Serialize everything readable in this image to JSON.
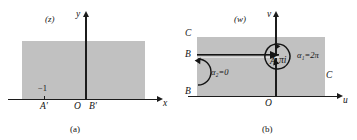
{
  "figure": {
    "panels": [
      {
        "id": "a",
        "caption": "(a)",
        "plane_tag": "(z)",
        "axes": {
          "x_label": "x",
          "y_label": "y"
        },
        "origin_label": "O",
        "point_labels": [
          {
            "name": "A-prime",
            "text": "A′"
          },
          {
            "name": "B-prime",
            "text": "B′"
          }
        ],
        "tick_label": "−1"
      },
      {
        "id": "b",
        "caption": "(b)",
        "plane_tag": "(w)",
        "axes": {
          "x_label": "u",
          "y_label": "v"
        },
        "origin_label": "O",
        "point_labels": [
          {
            "name": "point-A",
            "text": "A"
          },
          {
            "name": "pi-i",
            "text": "πi"
          },
          {
            "name": "corner-C-top-left",
            "text": "C"
          },
          {
            "name": "slit-B-left",
            "text": "B"
          },
          {
            "name": "corner-B-bottom-left",
            "text": "B"
          },
          {
            "name": "corner-C-right",
            "text": "C"
          }
        ],
        "angle_labels": [
          {
            "name": "alpha-1",
            "text": "α₁=2π"
          },
          {
            "name": "alpha-2",
            "text": "α₂=0"
          }
        ]
      }
    ]
  },
  "colors": {
    "shade": "#bcbcbc",
    "ink": "#141414",
    "page": "#ffffff"
  }
}
